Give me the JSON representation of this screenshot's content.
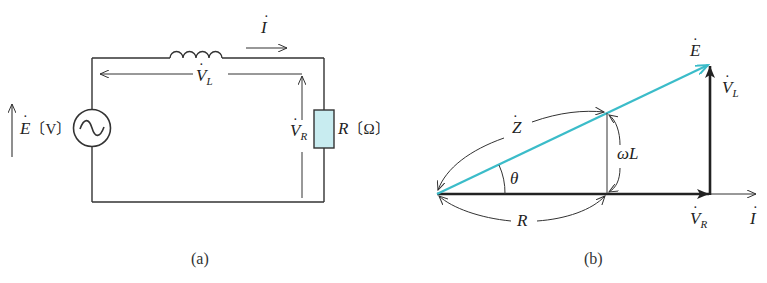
{
  "figure_a": {
    "caption": "(a)",
    "source_label": {
      "symbol": "E",
      "unit": "〔V〕"
    },
    "current_label": {
      "symbol": "I"
    },
    "inductor_voltage_label": {
      "symbol": "V",
      "sub": "L"
    },
    "resistor_voltage_label": {
      "symbol": "V",
      "sub": "R"
    },
    "resistor_label": {
      "symbol": "R",
      "unit": "〔Ω〕"
    },
    "resistor_fill": "#c8ecf0"
  },
  "figure_b": {
    "caption": "(b)",
    "e_label": {
      "symbol": "E"
    },
    "vl_label": {
      "symbol": "V",
      "sub": "L"
    },
    "vr_label": {
      "symbol": "V",
      "sub": "R"
    },
    "i_label": {
      "symbol": "I"
    },
    "z_label": {
      "symbol": "Z"
    },
    "wl_label": "ωL",
    "r_label": "R",
    "theta_label": "θ",
    "e_vector_color": "#3bbcc9"
  }
}
